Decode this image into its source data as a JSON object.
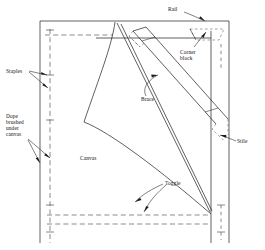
{
  "diagram": {
    "background_color": "#ffffff",
    "line_color": "#1d1d1d",
    "dashed_line_color": "#5a5a5a",
    "labels": {
      "rail": "Rail",
      "corner_block": "Corner\nblock",
      "brace": "Brace",
      "stile": "Stile",
      "staples": "Staples",
      "dope": "Dope\nbrushed\nunder\ncanvas",
      "canvas": "Canvas",
      "toggle": "Toggle"
    }
  }
}
